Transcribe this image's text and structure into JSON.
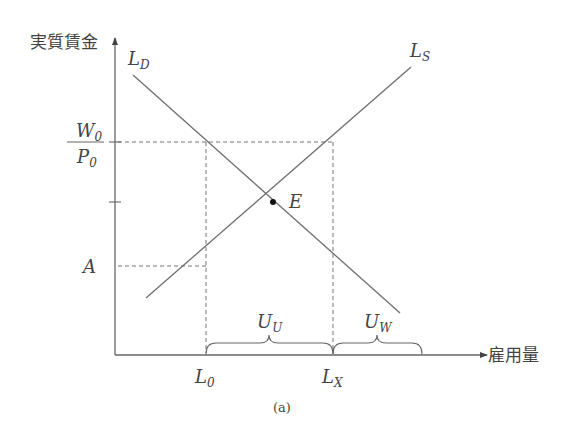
{
  "diagram": {
    "caption": "(a)",
    "y_axis_label": "実質賃金",
    "x_axis_label": "雇用量",
    "curves": {
      "demand": {
        "label": "L",
        "sub": "D"
      },
      "supply": {
        "label": "L",
        "sub": "S"
      }
    },
    "equilibrium": {
      "label": "E"
    },
    "y_labels": {
      "wage_num": {
        "label": "W",
        "sub": "0"
      },
      "wage_den": {
        "label": "P",
        "sub": "0"
      },
      "a": "A"
    },
    "x_labels": {
      "l0": {
        "label": "L",
        "sub": "0"
      },
      "lx": {
        "label": "L",
        "sub": "X"
      }
    },
    "braces": {
      "uu": {
        "label": "U",
        "sub": "U"
      },
      "uw": {
        "label": "U",
        "sub": "W"
      }
    },
    "colors": {
      "line": "#6e6e6e",
      "text": "#444444"
    }
  }
}
